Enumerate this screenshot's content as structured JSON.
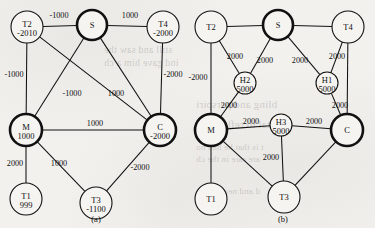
{
  "figure": {
    "title": "",
    "background_color": "#f2f1ee",
    "ink_color": "#111111"
  },
  "panels": [
    {
      "id": "a",
      "caption": "(a)",
      "caption_pos": {
        "x": 96,
        "y": 222
      },
      "nodes": [
        {
          "id": "T2",
          "name": "T2",
          "value": "-2010",
          "x": 27,
          "y": 27,
          "r": 16,
          "bold": false
        },
        {
          "id": "S",
          "name": "S",
          "value": "",
          "x": 92,
          "y": 25,
          "r": 15,
          "bold": true
        },
        {
          "id": "T4",
          "name": "T4",
          "value": "-2000",
          "x": 163,
          "y": 27,
          "r": 16,
          "bold": false
        },
        {
          "id": "M",
          "name": "M",
          "value": "1000",
          "x": 26,
          "y": 130,
          "r": 16,
          "bold": true
        },
        {
          "id": "C",
          "name": "C",
          "value": "-2000",
          "x": 160,
          "y": 130,
          "r": 16,
          "bold": true
        },
        {
          "id": "T1",
          "name": "T1",
          "value": "999",
          "x": 26,
          "y": 199,
          "r": 16,
          "bold": false
        },
        {
          "id": "T3",
          "name": "T3",
          "value": "-1100",
          "x": 96,
          "y": 203,
          "r": 16,
          "bold": false
        }
      ],
      "edges": [
        {
          "from": "T2",
          "to": "S",
          "label": "-1000",
          "lx": 59,
          "ly": 18
        },
        {
          "from": "S",
          "to": "T4",
          "label": "1000",
          "lx": 130,
          "ly": 18
        },
        {
          "from": "T2",
          "to": "M",
          "label": "-1000",
          "lx": 14,
          "ly": 77
        },
        {
          "from": "T4",
          "to": "C",
          "label": "-2000",
          "lx": 173,
          "ly": 77
        },
        {
          "from": "T2",
          "to": "C",
          "label": "",
          "lx": 0,
          "ly": 0
        },
        {
          "from": "S",
          "to": "M",
          "label": "-1000",
          "lx": 72,
          "ly": 96
        },
        {
          "from": "S",
          "to": "C",
          "label": "1000",
          "lx": 116,
          "ly": 96
        },
        {
          "from": "M",
          "to": "C",
          "label": "1000",
          "lx": 95,
          "ly": 126
        },
        {
          "from": "M",
          "to": "T1",
          "label": "2000",
          "lx": 15,
          "ly": 166
        },
        {
          "from": "M",
          "to": "T3",
          "label": "1000",
          "lx": 59,
          "ly": 166
        },
        {
          "from": "T3",
          "to": "C",
          "label": "-2000",
          "lx": 140,
          "ly": 170
        }
      ]
    },
    {
      "id": "b",
      "caption": "(b)",
      "caption_pos": {
        "x": 283,
        "y": 222
      },
      "nodes": [
        {
          "id": "T2",
          "name": "T2",
          "value": "",
          "x": 211,
          "y": 27,
          "r": 16,
          "bold": false
        },
        {
          "id": "S",
          "name": "S",
          "value": "",
          "x": 278,
          "y": 25,
          "r": 15,
          "bold": true
        },
        {
          "id": "T4",
          "name": "T4",
          "value": "",
          "x": 348,
          "y": 27,
          "r": 16,
          "bold": false
        },
        {
          "id": "H2",
          "name": "H2",
          "value": "5000",
          "x": 245,
          "y": 83,
          "r": 11,
          "bold": false
        },
        {
          "id": "H1",
          "name": "H1",
          "value": "5000",
          "x": 327,
          "y": 83,
          "r": 11,
          "bold": false
        },
        {
          "id": "M",
          "name": "M",
          "value": "",
          "x": 211,
          "y": 130,
          "r": 16,
          "bold": true
        },
        {
          "id": "H3",
          "name": "H3",
          "value": "5000",
          "x": 281,
          "y": 125,
          "r": 11,
          "bold": false
        },
        {
          "id": "C",
          "name": "C",
          "value": "",
          "x": 347,
          "y": 130,
          "r": 16,
          "bold": true
        },
        {
          "id": "T1",
          "name": "T1",
          "value": "",
          "x": 211,
          "y": 199,
          "r": 16,
          "bold": false
        },
        {
          "id": "T3",
          "name": "T3",
          "value": "",
          "x": 284,
          "y": 197,
          "r": 16,
          "bold": false
        }
      ],
      "edges": [
        {
          "from": "T2",
          "to": "S",
          "label": "",
          "lx": 0,
          "ly": 0
        },
        {
          "from": "S",
          "to": "T4",
          "label": "",
          "lx": 0,
          "ly": 0
        },
        {
          "from": "T2",
          "to": "H2",
          "label": "2000",
          "lx": 235,
          "ly": 59
        },
        {
          "from": "S",
          "to": "H2",
          "label": "2000",
          "lx": 265,
          "ly": 63
        },
        {
          "from": "S",
          "to": "H1",
          "label": "2000",
          "lx": 300,
          "ly": 63
        },
        {
          "from": "T4",
          "to": "H1",
          "label": "2000",
          "lx": 337,
          "ly": 59
        },
        {
          "from": "T2",
          "to": "M",
          "label": "-2000",
          "lx": 198,
          "ly": 80
        },
        {
          "from": "T4",
          "to": "C",
          "label": "",
          "lx": 0,
          "ly": 0
        },
        {
          "from": "H2",
          "to": "M",
          "label": "2000",
          "lx": 229,
          "ly": 108
        },
        {
          "from": "H1",
          "to": "C",
          "label": "2000",
          "lx": 340,
          "ly": 108
        },
        {
          "from": "M",
          "to": "H3",
          "label": "2000",
          "lx": 251,
          "ly": 124
        },
        {
          "from": "H3",
          "to": "C",
          "label": "2000",
          "lx": 314,
          "ly": 124
        },
        {
          "from": "H3",
          "to": "T3",
          "label": "2000",
          "lx": 271,
          "ly": 160
        },
        {
          "from": "M",
          "to": "T1",
          "label": "",
          "lx": 0,
          "ly": 0
        },
        {
          "from": "M",
          "to": "T3",
          "label": "",
          "lx": 0,
          "ly": 0
        },
        {
          "from": "T3",
          "to": "C",
          "label": "",
          "lx": 0,
          "ly": 0
        }
      ]
    }
  ],
  "bleed_through_text": [
    {
      "text": "still and saw the",
      "x": 104,
      "y": 44,
      "size": 10
    },
    {
      "text": "ind gave him a ch",
      "x": 104,
      "y": 57,
      "size": 10
    },
    {
      "text": "bling and perspiri",
      "x": 196,
      "y": 98,
      "size": 11
    },
    {
      "text": "t is that he had no",
      "x": 196,
      "y": 142,
      "size": 9
    },
    {
      "text": "are rare in the ch",
      "x": 196,
      "y": 154,
      "size": 9
    },
    {
      "text": "Capital to reflect",
      "x": 214,
      "y": 118,
      "size": 11
    },
    {
      "text": "d and near a",
      "x": 214,
      "y": 186,
      "size": 9
    }
  ]
}
